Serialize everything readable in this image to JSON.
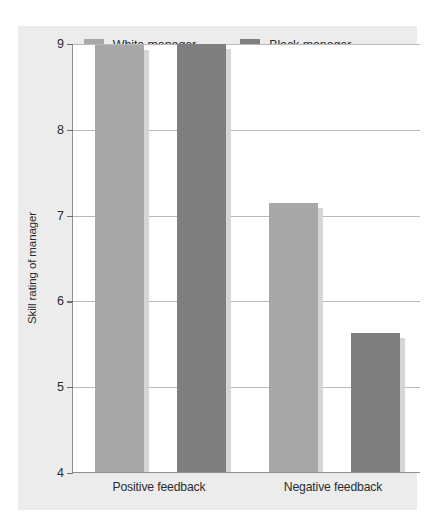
{
  "figure": {
    "panel_color": "#ececed",
    "plot_bg": "#ffffff",
    "axis_color": "#8f8f8f",
    "grid_color": "#b9b9b9"
  },
  "legend": {
    "entries": [
      {
        "label": "White manager",
        "color": "#a8a8a8",
        "swatch_name": "legend-swatch-white-manager"
      },
      {
        "label": "Black manager",
        "color": "#7f7f80",
        "swatch_name": "legend-swatch-black-manager"
      }
    ]
  },
  "chart_data": {
    "type": "bar",
    "title": "",
    "xlabel": "",
    "ylabel": "Skill rating of manager",
    "categories": [
      "Positive feedback",
      "Negative feedback"
    ],
    "ylim": [
      4,
      9
    ],
    "yticks": [
      9,
      8,
      7,
      6,
      5,
      4
    ],
    "ytick_labels": [
      "9",
      "8",
      "7",
      "6",
      "5",
      "4"
    ],
    "grid": true,
    "legend_position": "top-center",
    "series": [
      {
        "name": "White manager",
        "color": "#a8a8a8",
        "values": [
          8.98,
          7.14
        ]
      },
      {
        "name": "Black manager",
        "color": "#7f7f80",
        "values": [
          8.99,
          5.62
        ]
      }
    ]
  }
}
